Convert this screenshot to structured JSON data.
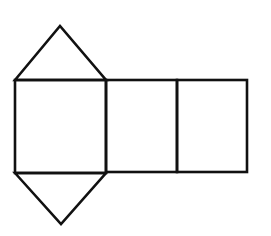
{
  "diagram": {
    "stroke_color": "#111111",
    "background_color": "#ffffff",
    "faces": [
      {
        "id": "top-triangle",
        "type": "triangle",
        "points": [
          [
            15,
            80
          ],
          [
            60,
            26
          ],
          [
            106,
            80
          ]
        ]
      },
      {
        "id": "left-rectangle",
        "type": "rectangle",
        "x": 15,
        "y": 80,
        "width": 91,
        "height": 93
      },
      {
        "id": "middle-rectangle",
        "type": "rectangle",
        "x": 106,
        "y": 80,
        "width": 71,
        "height": 92
      },
      {
        "id": "right-rectangle",
        "type": "rectangle",
        "x": 177,
        "y": 80,
        "width": 70,
        "height": 92
      },
      {
        "id": "bottom-triangle",
        "type": "triangle",
        "points": [
          [
            15,
            173
          ],
          [
            61,
            224
          ],
          [
            106,
            173
          ]
        ]
      }
    ]
  }
}
